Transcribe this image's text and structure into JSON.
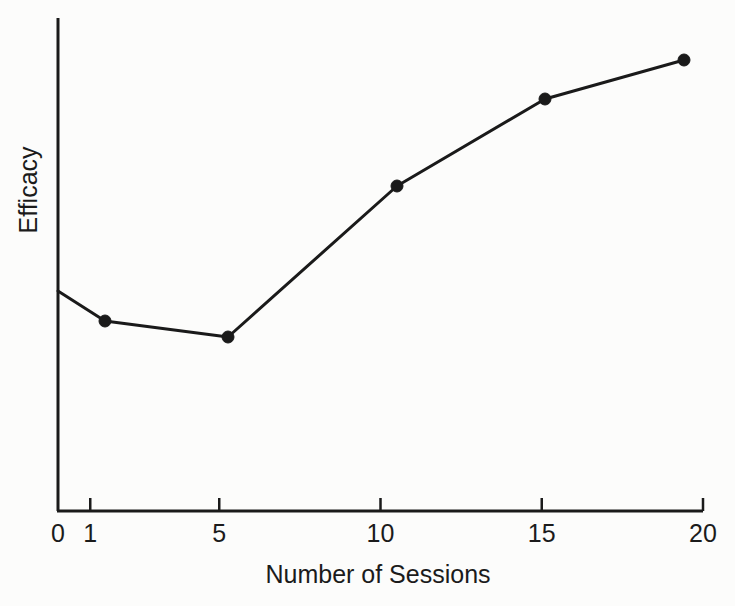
{
  "chart_data": {
    "type": "line",
    "title": "",
    "subtitle": "",
    "xlabel": "Number of Sessions",
    "ylabel": "Efficacy",
    "xlim": [
      0,
      20
    ],
    "ylim": [
      0,
      1
    ],
    "grid": false,
    "legend": null,
    "xticks": [
      0,
      1,
      5,
      10,
      15,
      20
    ],
    "xtick_labels": [
      "0",
      "1",
      "5",
      "10",
      "15",
      "20"
    ],
    "yticks": [],
    "ytick_labels": [],
    "annotations": [],
    "series": [
      {
        "name": "Efficacy",
        "color": "#1a1a1a",
        "line_width": 3,
        "marker": "circle",
        "marker_size": 6,
        "x": [
          0,
          1.45,
          5.27,
          10.5,
          15.1,
          19.4
        ],
        "y": [
          0.448,
          0.385,
          0.353,
          0.659,
          0.836,
          0.916
        ],
        "points_px": [
          {
            "x": 58,
            "y": 291,
            "marker": false
          },
          {
            "x": 105,
            "y": 321,
            "marker": true
          },
          {
            "x": 228,
            "y": 337,
            "marker": true
          },
          {
            "x": 397,
            "y": 186,
            "marker": true
          },
          {
            "x": 545,
            "y": 99,
            "marker": true
          },
          {
            "x": 684,
            "y": 60,
            "marker": true
          }
        ]
      }
    ]
  },
  "axes": {
    "line_color": "#1a1a1a",
    "axis_width": 3,
    "x_axis_y_px": 511,
    "y_axis_x_px": 58,
    "y_axis_top_px": 18,
    "x_axis_right_px": 703,
    "tick_length_px": 13
  },
  "colors": {
    "background": "#fcfcfb",
    "foreground": "#1a1a1a",
    "text": "#1b1b1b"
  }
}
